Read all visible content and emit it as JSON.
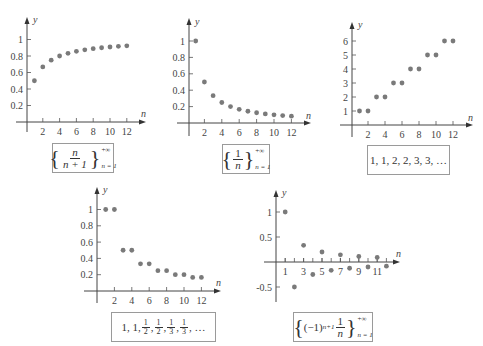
{
  "chart_data": [
    {
      "type": "scatter",
      "title": "",
      "caption": "{n/(n+1)}, n=1 to +∞",
      "xlabel": "n",
      "ylabel": "y",
      "x": [
        1,
        2,
        3,
        4,
        5,
        6,
        7,
        8,
        9,
        10,
        11,
        12
      ],
      "values": [
        0.5,
        0.667,
        0.75,
        0.8,
        0.833,
        0.857,
        0.875,
        0.889,
        0.9,
        0.909,
        0.917,
        0.923
      ],
      "xticks": [
        2,
        4,
        6,
        8,
        10,
        12
      ],
      "yticks": [
        0.2,
        0.4,
        0.6,
        0.8,
        1
      ],
      "xlim": [
        0,
        14
      ],
      "ylim": [
        0,
        1.15
      ],
      "grid": false
    },
    {
      "type": "scatter",
      "title": "",
      "caption": "{1/n}, n=1 to +∞",
      "xlabel": "n",
      "ylabel": "y",
      "x": [
        1,
        2,
        3,
        4,
        5,
        6,
        7,
        8,
        9,
        10,
        11,
        12
      ],
      "values": [
        1,
        0.5,
        0.333,
        0.25,
        0.2,
        0.167,
        0.143,
        0.125,
        0.111,
        0.1,
        0.091,
        0.083
      ],
      "xticks": [
        2,
        4,
        6,
        8,
        10,
        12
      ],
      "yticks": [
        0.2,
        0.4,
        0.6,
        0.8,
        1
      ],
      "xlim": [
        0,
        14
      ],
      "ylim": [
        0,
        1.15
      ],
      "grid": false
    },
    {
      "type": "scatter",
      "title": "",
      "caption": "1, 1, 2, 2, 3, 3, ...",
      "xlabel": "n",
      "ylabel": "y",
      "x": [
        1,
        2,
        3,
        4,
        5,
        6,
        7,
        8,
        9,
        10,
        11,
        12
      ],
      "values": [
        1,
        1,
        2,
        2,
        3,
        3,
        4,
        4,
        5,
        5,
        6,
        6
      ],
      "xticks": [
        2,
        4,
        6,
        8,
        10,
        12
      ],
      "yticks": [
        1,
        2,
        3,
        4,
        5,
        6
      ],
      "xlim": [
        0,
        14
      ],
      "ylim": [
        0,
        7
      ],
      "grid": false
    },
    {
      "type": "scatter",
      "title": "",
      "caption": "1, 1, 1/2, 1/2, 1/3, 1/3, ...",
      "xlabel": "n",
      "ylabel": "y",
      "x": [
        1,
        2,
        3,
        4,
        5,
        6,
        7,
        8,
        9,
        10,
        11,
        12
      ],
      "values": [
        1,
        1,
        0.5,
        0.5,
        0.333,
        0.333,
        0.25,
        0.25,
        0.2,
        0.2,
        0.167,
        0.167
      ],
      "xticks": [
        2,
        4,
        6,
        8,
        10,
        12
      ],
      "yticks": [
        0.2,
        0.4,
        0.6,
        0.8,
        1
      ],
      "xlim": [
        0,
        14
      ],
      "ylim": [
        0,
        1.15
      ],
      "grid": false
    },
    {
      "type": "scatter",
      "title": "",
      "caption": "{(-1)^(n+1) (1/n)}, n=1 to +∞",
      "xlabel": "n",
      "ylabel": "y",
      "x": [
        1,
        2,
        3,
        4,
        5,
        6,
        7,
        8,
        9,
        10,
        11,
        12
      ],
      "values": [
        1,
        -0.5,
        0.333,
        -0.25,
        0.2,
        -0.167,
        0.143,
        -0.125,
        0.111,
        -0.1,
        0.091,
        -0.083
      ],
      "xticks": [
        1,
        3,
        5,
        7,
        9,
        11
      ],
      "yticks": [
        -0.5,
        0.5,
        1
      ],
      "xlim": [
        0,
        13
      ],
      "ylim": [
        -0.75,
        1.25
      ],
      "grid": false
    }
  ],
  "labels": {
    "x_axis": "n",
    "y_axis": "y"
  },
  "plots": [
    {
      "xticklabels": [
        "2",
        "4",
        "6",
        "8",
        "10",
        "12"
      ],
      "yticklabels": [
        "0.2",
        "0.4",
        "0.6",
        "0.8",
        "1"
      ],
      "caption": {
        "num": "n",
        "den": "n + 1",
        "upper": "+∞",
        "lower": "n = 1"
      }
    },
    {
      "xticklabels": [
        "2",
        "4",
        "6",
        "8",
        "10",
        "12"
      ],
      "yticklabels": [
        "0.2",
        "0.4",
        "0.6",
        "0.8",
        "1"
      ],
      "caption": {
        "num": "1",
        "den": "n",
        "upper": "+∞",
        "lower": "n = 1"
      }
    },
    {
      "xticklabels": [
        "2",
        "4",
        "6",
        "8",
        "10",
        "12"
      ],
      "yticklabels": [
        "1",
        "2",
        "3",
        "4",
        "5",
        "6"
      ],
      "caption": {
        "text": "1, 1, 2, 2, 3, 3, …"
      }
    },
    {
      "xticklabels": [
        "2",
        "4",
        "6",
        "8",
        "10",
        "12"
      ],
      "yticklabels": [
        "0.2",
        "0.4",
        "0.6",
        "0.8",
        "1"
      ],
      "caption": {
        "prefix": "1, 1,",
        "fracs": [
          "2",
          "2",
          "3",
          "3"
        ],
        "suffix": "…"
      }
    },
    {
      "xticklabels": [
        "1",
        "3",
        "5",
        "7",
        "9",
        "11"
      ],
      "yticklabels": [
        "-0.5",
        "0.5",
        "1"
      ],
      "caption": {
        "base": "(−1)",
        "exp": "n+1",
        "num": "1",
        "den": "n",
        "upper": "+∞",
        "lower": "n = 1"
      }
    }
  ]
}
